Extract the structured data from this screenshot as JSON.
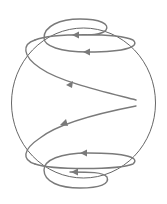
{
  "diagram": {
    "title": "Spiral flow lines on a sphere",
    "colors": {
      "background": "#ffffff",
      "sphere_outline": "#555555",
      "spiral_lines": "#7a7a7a",
      "arrowheads": "#7a7a7a"
    },
    "elements": [
      {
        "name": "sphere-outline",
        "kind": "circle"
      },
      {
        "name": "upper-spiral",
        "kind": "curve",
        "direction": "leftward, winding toward north pole",
        "arrow_count": 3
      },
      {
        "name": "lower-spiral",
        "kind": "curve",
        "direction": "leftward, winding toward south pole",
        "arrow_count": 3
      }
    ]
  }
}
